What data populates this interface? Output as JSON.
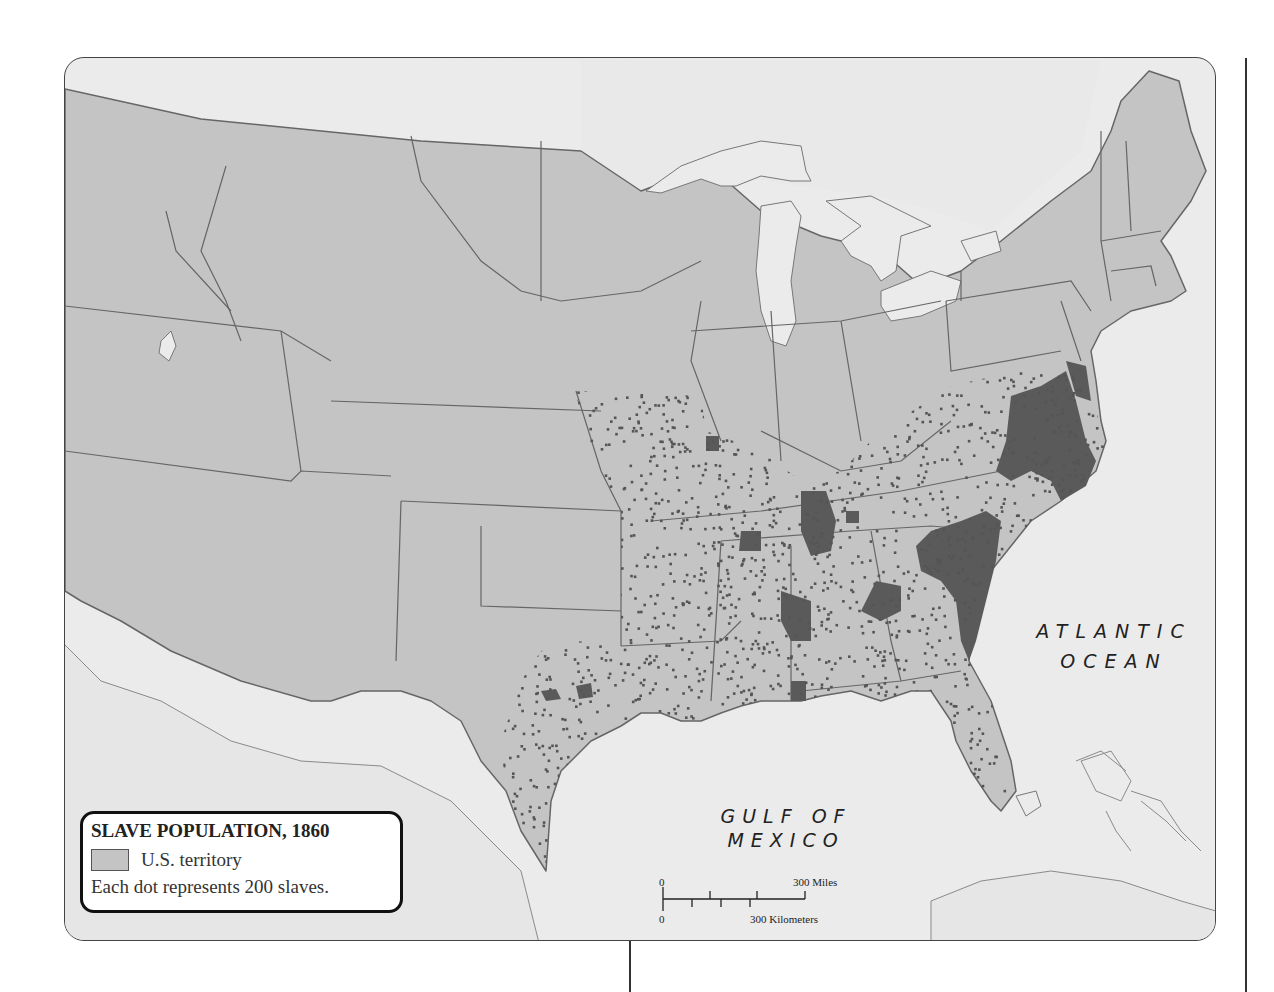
{
  "map": {
    "title": "SLAVE POPULATION, 1860",
    "colors": {
      "land": "#c4c4c4",
      "water": "#ebebeb",
      "foreign_land": "#e6e6e6",
      "border": "#666666",
      "dense": "#5a5a5a",
      "dot": "#555555"
    },
    "labels": {
      "atlantic_line1": "ATLANTIC",
      "atlantic_line2": "OCEAN",
      "gulf": "GULF OF MEXICO"
    }
  },
  "legend": {
    "title": "SLAVE POPULATION, 1860",
    "items": [
      {
        "swatch": "land",
        "label": "U.S. territory"
      }
    ],
    "note": "Each dot represents 200 slaves."
  },
  "scale": {
    "miles_zero": "0",
    "miles_label": "300 Miles",
    "km_zero": "0",
    "km_label": "300 Kilometers"
  }
}
